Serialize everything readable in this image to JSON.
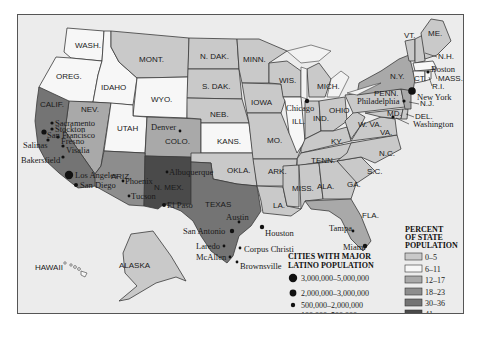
{
  "map": {
    "subject": "Latino population by state",
    "shade_colors": {
      "0-5": "#c9c9c9",
      "6-11": "#f7f7f7",
      "12-17": "#a9a9a9",
      "18-23": "#8d8d8d",
      "30-36": "#747474",
      "41": "#4a4a4a"
    },
    "states": [
      {
        "label": "WASH.",
        "shade": "6-11"
      },
      {
        "label": "OREG.",
        "shade": "6-11"
      },
      {
        "label": "IDAHO",
        "shade": "6-11"
      },
      {
        "label": "MONT.",
        "shade": "0-5"
      },
      {
        "label": "WYO.",
        "shade": "6-11"
      },
      {
        "label": "N. DAK.",
        "shade": "0-5"
      },
      {
        "label": "S. DAK.",
        "shade": "0-5"
      },
      {
        "label": "NEB.",
        "shade": "0-5"
      },
      {
        "label": "KANS.",
        "shade": "6-11"
      },
      {
        "label": "MINN.",
        "shade": "0-5"
      },
      {
        "label": "WIS.",
        "shade": "0-5"
      },
      {
        "label": "IOWA",
        "shade": "0-5"
      },
      {
        "label": "MO.",
        "shade": "0-5"
      },
      {
        "label": "ILL.",
        "shade": "6-11"
      },
      {
        "label": "MICH.",
        "shade": "0-5"
      },
      {
        "label": "IND.",
        "shade": "0-5"
      },
      {
        "label": "OHIO",
        "shade": "0-5"
      },
      {
        "label": "KY.",
        "shade": "0-5"
      },
      {
        "label": "TENN.",
        "shade": "0-5"
      },
      {
        "label": "W. VA.",
        "shade": "0-5"
      },
      {
        "label": "VA.",
        "shade": "0-5"
      },
      {
        "label": "N.C.",
        "shade": "0-5"
      },
      {
        "label": "S.C.",
        "shade": "0-5"
      },
      {
        "label": "GA.",
        "shade": "0-5"
      },
      {
        "label": "ALA.",
        "shade": "0-5"
      },
      {
        "label": "MISS.",
        "shade": "0-5"
      },
      {
        "label": "LA.",
        "shade": "0-5"
      },
      {
        "label": "ARK.",
        "shade": "0-5"
      },
      {
        "label": "OKLA.",
        "shade": "0-5"
      },
      {
        "label": "TEXAS",
        "shade": "30-36"
      },
      {
        "label": "N. MEX.",
        "shade": "41"
      },
      {
        "label": "ARIZ.",
        "shade": "18-23"
      },
      {
        "label": "COLO.",
        "shade": "12-17"
      },
      {
        "label": "UTAH",
        "shade": "6-11"
      },
      {
        "label": "NEV.",
        "shade": "12-17"
      },
      {
        "label": "CALIF.",
        "shade": "30-36"
      },
      {
        "label": "FLA.",
        "shade": "12-17"
      },
      {
        "label": "N.Y.",
        "shade": "12-17"
      },
      {
        "label": "N.J.",
        "shade": "12-17"
      },
      {
        "label": "PENN.",
        "shade": "0-5"
      },
      {
        "label": "MD.",
        "shade": "0-5"
      },
      {
        "label": "DEL.",
        "shade": "0-5"
      },
      {
        "label": "CT.",
        "shade": "6-11"
      },
      {
        "label": "R.I.",
        "shade": "6-11"
      },
      {
        "label": "MASS.",
        "shade": "6-11"
      },
      {
        "label": "VT.",
        "shade": "0-5"
      },
      {
        "label": "N.H.",
        "shade": "0-5"
      },
      {
        "label": "ME.",
        "shade": "0-5"
      },
      {
        "label": "ALASKA",
        "shade": "0-5"
      },
      {
        "label": "HAWAII",
        "shade": "6-11"
      }
    ],
    "cities": [
      {
        "name": "Sacramento"
      },
      {
        "name": "Stockton"
      },
      {
        "name": "San Francisco"
      },
      {
        "name": "Fresno"
      },
      {
        "name": "Salinas"
      },
      {
        "name": "Visalia"
      },
      {
        "name": "Bakersfield"
      },
      {
        "name": "Los Angeles"
      },
      {
        "name": "San Diego"
      },
      {
        "name": "Phoenix"
      },
      {
        "name": "Tucson"
      },
      {
        "name": "Albuquerque"
      },
      {
        "name": "El Paso"
      },
      {
        "name": "Denver"
      },
      {
        "name": "Chicago"
      },
      {
        "name": "Austin"
      },
      {
        "name": "San Antonio"
      },
      {
        "name": "Houston"
      },
      {
        "name": "Corpus Christi"
      },
      {
        "name": "Laredo"
      },
      {
        "name": "McAllen"
      },
      {
        "name": "Brownsville"
      },
      {
        "name": "Tampa"
      },
      {
        "name": "Miami"
      },
      {
        "name": "New York"
      },
      {
        "name": "Philadelphia"
      },
      {
        "name": "Boston"
      },
      {
        "name": "Washington"
      }
    ]
  },
  "legend_cities": {
    "title_line1": "CITIES WITH MAJOR",
    "title_line2": "LATINO POPULATION",
    "items": [
      {
        "label": "3,000,000–5,000,000"
      },
      {
        "label": "2,000,000–3,000,000"
      },
      {
        "label": "500,000–2,000,000"
      },
      {
        "label": "100,000–500,000"
      }
    ]
  },
  "legend_percent": {
    "title_line1": "PERCENT",
    "title_line2": "OF STATE",
    "title_line3": "POPULATION",
    "items": [
      {
        "label": "0–5",
        "color": "#c9c9c9"
      },
      {
        "label": "6–11",
        "color": "#f7f7f7"
      },
      {
        "label": "12–17",
        "color": "#a9a9a9"
      },
      {
        "label": "18–23",
        "color": "#8d8d8d"
      },
      {
        "label": "30–36",
        "color": "#747474"
      },
      {
        "label": "41",
        "color": "#4a4a4a"
      }
    ]
  }
}
